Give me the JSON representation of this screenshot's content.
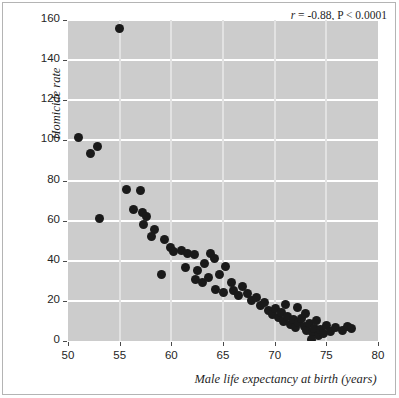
{
  "chart_data": {
    "type": "scatter",
    "title": "",
    "xlabel": "Male life expectancy at birth (years)",
    "ylabel": "Homicide rate",
    "xlim": [
      50,
      80
    ],
    "ylim": [
      0,
      160
    ],
    "xticks": [
      50,
      55,
      60,
      65,
      70,
      75,
      80
    ],
    "yticks": [
      0,
      20,
      40,
      60,
      80,
      100,
      120,
      140,
      160
    ],
    "grid": "horizontal-white-gridlines-on-gray-panel",
    "legend": "none",
    "annotation": {
      "r_symbol": "r",
      "text": " = -0.88, P < 0.0001",
      "full_text": "r = -0.88, P < 0.0001",
      "correlation": -0.88,
      "p_value": "< 0.0001",
      "position": "top-right"
    },
    "marker": {
      "shape": "circle",
      "color": "#1a1a1a",
      "size_px": 9
    },
    "panel_color": "#cccccc",
    "gridline_color": "#ffffff",
    "n_points": 72,
    "points": [
      [
        55.0,
        156.0
      ],
      [
        51.0,
        101.5
      ],
      [
        52.9,
        97.0
      ],
      [
        52.2,
        93.5
      ],
      [
        55.7,
        75.5
      ],
      [
        57.0,
        75.0
      ],
      [
        53.0,
        61.0
      ],
      [
        56.3,
        65.5
      ],
      [
        57.2,
        64.0
      ],
      [
        57.6,
        62.0
      ],
      [
        57.3,
        58.0
      ],
      [
        58.4,
        55.5
      ],
      [
        58.1,
        52.0
      ],
      [
        59.3,
        50.5
      ],
      [
        59.9,
        46.5
      ],
      [
        61.0,
        45.0
      ],
      [
        60.2,
        44.5
      ],
      [
        61.6,
        43.5
      ],
      [
        62.2,
        43.0
      ],
      [
        59.0,
        33.0
      ],
      [
        61.4,
        36.5
      ],
      [
        62.5,
        35.0
      ],
      [
        63.2,
        38.5
      ],
      [
        63.8,
        43.5
      ],
      [
        64.2,
        41.0
      ],
      [
        62.3,
        30.5
      ],
      [
        63.0,
        29.0
      ],
      [
        63.6,
        31.5
      ],
      [
        64.7,
        33.0
      ],
      [
        65.2,
        37.0
      ],
      [
        65.8,
        29.0
      ],
      [
        64.3,
        25.5
      ],
      [
        65.0,
        24.0
      ],
      [
        66.0,
        25.0
      ],
      [
        66.5,
        22.5
      ],
      [
        66.9,
        27.0
      ],
      [
        67.4,
        23.5
      ],
      [
        67.8,
        20.0
      ],
      [
        68.2,
        21.5
      ],
      [
        68.6,
        17.5
      ],
      [
        69.0,
        19.0
      ],
      [
        69.4,
        15.0
      ],
      [
        69.8,
        13.0
      ],
      [
        70.1,
        16.0
      ],
      [
        70.4,
        11.5
      ],
      [
        70.7,
        14.0
      ],
      [
        70.9,
        9.5
      ],
      [
        71.2,
        12.0
      ],
      [
        71.5,
        8.0
      ],
      [
        71.8,
        10.5
      ],
      [
        72.0,
        6.5
      ],
      [
        72.3,
        9.0
      ],
      [
        72.6,
        11.0
      ],
      [
        72.9,
        7.0
      ],
      [
        73.1,
        5.0
      ],
      [
        73.4,
        8.5
      ],
      [
        73.7,
        4.0
      ],
      [
        73.9,
        6.0
      ],
      [
        74.2,
        2.5
      ],
      [
        74.4,
        5.5
      ],
      [
        74.7,
        3.5
      ],
      [
        71.0,
        18.0
      ],
      [
        72.2,
        16.5
      ],
      [
        73.0,
        13.5
      ],
      [
        74.0,
        10.0
      ],
      [
        75.0,
        7.5
      ],
      [
        75.4,
        4.5
      ],
      [
        75.9,
        6.5
      ],
      [
        76.6,
        5.0
      ],
      [
        77.0,
        7.0
      ],
      [
        77.4,
        6.0
      ],
      [
        73.6,
        0.5
      ]
    ]
  }
}
